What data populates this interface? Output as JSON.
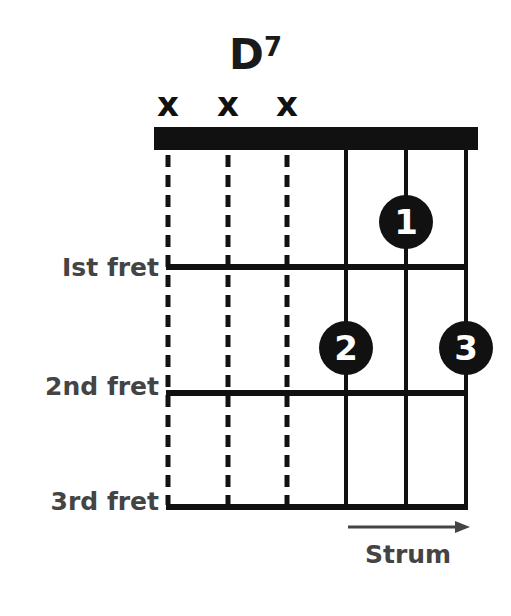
{
  "chord": {
    "name": "D",
    "superscript": "7"
  },
  "muted_strings": [
    {
      "string": 6,
      "symbol": "x"
    },
    {
      "string": 5,
      "symbol": "x"
    },
    {
      "string": 4,
      "symbol": "x"
    }
  ],
  "fret_labels": [
    "Ist fret",
    "2nd fret",
    "3rd fret"
  ],
  "fingers": [
    {
      "finger": "1",
      "string": 2,
      "fret": 1
    },
    {
      "finger": "2",
      "string": 3,
      "fret": 2
    },
    {
      "finger": "3",
      "string": 1,
      "fret": 2
    }
  ],
  "strum": {
    "label": "Strum",
    "direction": "right"
  },
  "colors": {
    "ink": "#111111",
    "label": "#444444",
    "background": "#ffffff"
  }
}
